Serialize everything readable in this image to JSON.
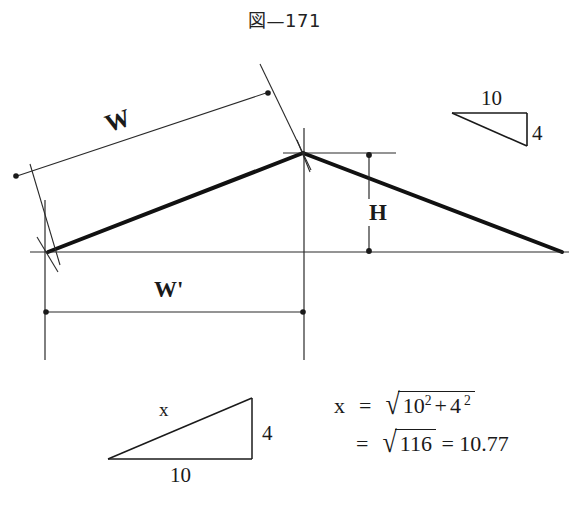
{
  "figure": {
    "title": "図—171",
    "caption_number": "171"
  },
  "main_diagram": {
    "name": "roof-pitch-diagram",
    "labels": {
      "rafter_length": "W",
      "half_span": "W'",
      "rise": "H"
    },
    "geometry": {
      "left_eave": {
        "x": 48,
        "y": 252
      },
      "ridge_peak": {
        "x": 303,
        "y": 153
      },
      "right_eave": {
        "x": 562,
        "y": 252
      },
      "baseline_y": 252,
      "w_dimension_from": {
        "x": 14,
        "y": 177
      },
      "w_dimension_to": {
        "x": 269,
        "y": 92
      },
      "wprime_dimension_y": 312,
      "wprime_from_x": 45,
      "wprime_to_x": 304,
      "h_dimension_x": 369,
      "h_top_y": 154,
      "h_bottom_y": 253
    }
  },
  "triangle_top_right": {
    "name": "pitch-ratio-triangle",
    "base_label": "10",
    "rise_label": "4",
    "points": {
      "left": {
        "x": 452,
        "y": 113
      },
      "top_right": {
        "x": 527,
        "y": 113
      },
      "bottom_right": {
        "x": 527,
        "y": 146
      }
    }
  },
  "triangle_bottom_left": {
    "name": "hypotenuse-triangle",
    "hypotenuse_label": "x",
    "rise_label": "4",
    "base_label": "10",
    "points": {
      "bottom_left": {
        "x": 108,
        "y": 459
      },
      "bottom_right": {
        "x": 252,
        "y": 459
      },
      "top_right": {
        "x": 252,
        "y": 398
      }
    }
  },
  "equation": {
    "name": "hypotenuse-calculation",
    "line1": {
      "lhs": "x",
      "equals": "=",
      "radical_content_base1": "10",
      "exponent1": "2",
      "plus": "+",
      "radical_content_base2": "4",
      "exponent2": "2"
    },
    "line2": {
      "equals1": "=",
      "radical_content": "116",
      "equals2": "=",
      "result": "10.77"
    },
    "plain_text": "x = √(10² + 4²) = √116 = 10.77"
  },
  "colors": {
    "ink": "#1a1a1a",
    "thin_line": "#2a2a2a",
    "background": "#ffffff"
  }
}
